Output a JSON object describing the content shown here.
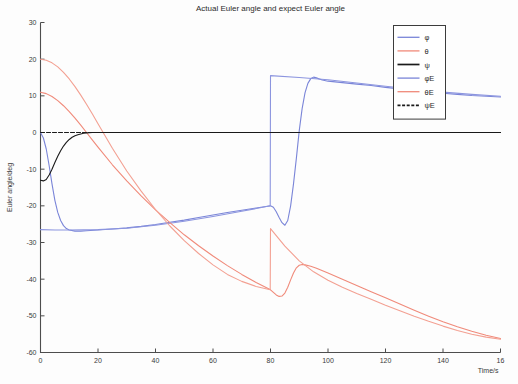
{
  "chart_data": {
    "type": "line",
    "title": "Actual Euler angle and expect Euler angle",
    "xlabel": "Time/s",
    "ylabel": "Euler angle/deg",
    "xlim": [
      0,
      160
    ],
    "ylim": [
      -60,
      30
    ],
    "xticks": [
      0,
      20,
      40,
      60,
      80,
      100,
      120,
      140,
      160
    ],
    "xtick_labels": [
      "0",
      "20",
      "40",
      "60",
      "80",
      "100",
      "120",
      "140",
      "16"
    ],
    "yticks": [
      30,
      20,
      10,
      0,
      -10,
      -20,
      -30,
      -40,
      -50,
      -60
    ],
    "ytick_labels": [
      "30",
      "20",
      "10",
      "0",
      "-10",
      "-20",
      "-30",
      "-40",
      "-50",
      "-60"
    ],
    "grid": false,
    "legend_position": "upper right",
    "legend_entries": [
      {
        "label": "φ",
        "color": "#7a85d8",
        "style": "solid"
      },
      {
        "label": "θ",
        "color": "#f08a7a",
        "style": "solid"
      },
      {
        "label": "ψ",
        "color": "#1a1a1a",
        "style": "solid"
      },
      {
        "label": "φE",
        "color": "#7a85d8",
        "style": "solid"
      },
      {
        "label": "θE",
        "color": "#f08a7a",
        "style": "solid"
      },
      {
        "label": "ψE",
        "color": "#1a1a1a",
        "style": "dashed"
      }
    ],
    "series": [
      {
        "name": "φ",
        "color": "#7a85d8",
        "style": "solid",
        "points": [
          [
            0,
            0
          ],
          [
            1,
            -1.5
          ],
          [
            2,
            -4.5
          ],
          [
            3,
            -9
          ],
          [
            4,
            -14
          ],
          [
            5,
            -18.5
          ],
          [
            6,
            -21.8
          ],
          [
            7,
            -24
          ],
          [
            8,
            -25.4
          ],
          [
            9,
            -26.2
          ],
          [
            10,
            -26.6
          ],
          [
            12,
            -26.9
          ],
          [
            14,
            -26.9
          ],
          [
            16,
            -26.8
          ],
          [
            20,
            -26.6
          ],
          [
            25,
            -26.3
          ],
          [
            30,
            -26.0
          ],
          [
            35,
            -25.6
          ],
          [
            40,
            -25.1
          ],
          [
            45,
            -24.5
          ],
          [
            50,
            -23.9
          ],
          [
            55,
            -23.2
          ],
          [
            60,
            -22.5
          ],
          [
            65,
            -21.8
          ],
          [
            70,
            -21.2
          ],
          [
            75,
            -20.6
          ],
          [
            79,
            -20.1
          ],
          [
            80,
            -20.0
          ],
          [
            81,
            -20.4
          ],
          [
            82,
            -21.6
          ],
          [
            83,
            -23.2
          ],
          [
            84,
            -24.6
          ],
          [
            85,
            -25.3
          ],
          [
            86,
            -24.0
          ],
          [
            87,
            -20.0
          ],
          [
            88,
            -14.0
          ],
          [
            89,
            -7.0
          ],
          [
            90,
            0.5
          ],
          [
            91,
            6.5
          ],
          [
            92,
            10.8
          ],
          [
            93,
            13.4
          ],
          [
            94,
            14.7
          ],
          [
            95,
            15.1
          ],
          [
            96,
            14.9
          ],
          [
            97,
            14.6
          ],
          [
            98,
            14.3
          ],
          [
            100,
            14.0
          ],
          [
            105,
            13.6
          ],
          [
            110,
            13.2
          ],
          [
            115,
            12.8
          ],
          [
            120,
            12.3
          ],
          [
            125,
            11.9
          ],
          [
            130,
            11.5
          ],
          [
            135,
            11.1
          ],
          [
            140,
            10.7
          ],
          [
            145,
            10.4
          ],
          [
            150,
            10.1
          ],
          [
            155,
            9.9
          ],
          [
            160,
            9.7
          ]
        ]
      },
      {
        "name": "φE",
        "color": "#8c95df",
        "style": "solid",
        "points": [
          [
            0,
            -26.5
          ],
          [
            5,
            -26.6
          ],
          [
            10,
            -26.6
          ],
          [
            20,
            -26.5
          ],
          [
            30,
            -26.1
          ],
          [
            40,
            -25.3
          ],
          [
            50,
            -24.2
          ],
          [
            60,
            -22.9
          ],
          [
            70,
            -21.5
          ],
          [
            79.9,
            -20.0
          ],
          [
            80,
            15.5
          ],
          [
            90,
            15.0
          ],
          [
            100,
            14.4
          ],
          [
            110,
            13.5
          ],
          [
            120,
            12.6
          ],
          [
            130,
            11.8
          ],
          [
            140,
            11.0
          ],
          [
            150,
            10.4
          ],
          [
            160,
            9.9
          ]
        ]
      },
      {
        "name": "θ",
        "color": "#f08a7a",
        "style": "solid",
        "points": [
          [
            0,
            11.0
          ],
          [
            2,
            10.6
          ],
          [
            4,
            9.8
          ],
          [
            6,
            8.7
          ],
          [
            8,
            7.3
          ],
          [
            10,
            5.7
          ],
          [
            12,
            3.9
          ],
          [
            14,
            2.0
          ],
          [
            16,
            0.0
          ],
          [
            18,
            -2.0
          ],
          [
            20,
            -4.0
          ],
          [
            25,
            -8.8
          ],
          [
            30,
            -13.2
          ],
          [
            35,
            -17.3
          ],
          [
            40,
            -21.1
          ],
          [
            45,
            -24.6
          ],
          [
            50,
            -27.9
          ],
          [
            55,
            -30.9
          ],
          [
            60,
            -33.7
          ],
          [
            65,
            -36.3
          ],
          [
            70,
            -38.7
          ],
          [
            75,
            -40.9
          ],
          [
            79.5,
            -42.7
          ],
          [
            80,
            -42.9
          ],
          [
            81,
            -43.6
          ],
          [
            82,
            -44.3
          ],
          [
            83,
            -44.7
          ],
          [
            84,
            -44.6
          ],
          [
            85,
            -43.8
          ],
          [
            86,
            -42.2
          ],
          [
            87,
            -40.2
          ],
          [
            88,
            -38.3
          ],
          [
            89,
            -36.9
          ],
          [
            90,
            -36.2
          ],
          [
            91,
            -36.0
          ],
          [
            92,
            -36.1
          ],
          [
            94,
            -36.5
          ],
          [
            96,
            -37.0
          ],
          [
            100,
            -38.3
          ],
          [
            105,
            -40.0
          ],
          [
            110,
            -41.7
          ],
          [
            115,
            -43.4
          ],
          [
            120,
            -45.1
          ],
          [
            125,
            -46.8
          ],
          [
            130,
            -48.5
          ],
          [
            135,
            -50.1
          ],
          [
            140,
            -51.6
          ],
          [
            145,
            -53.0
          ],
          [
            150,
            -54.2
          ],
          [
            155,
            -55.3
          ],
          [
            160,
            -56.2
          ]
        ]
      },
      {
        "name": "θE",
        "color": "#f3a092",
        "style": "solid",
        "points": [
          [
            0,
            20.0
          ],
          [
            2,
            19.7
          ],
          [
            4,
            19.0
          ],
          [
            6,
            17.9
          ],
          [
            8,
            16.4
          ],
          [
            10,
            14.6
          ],
          [
            12,
            12.5
          ],
          [
            14,
            10.2
          ],
          [
            16,
            7.7
          ],
          [
            18,
            5.1
          ],
          [
            20,
            2.4
          ],
          [
            25,
            -4.3
          ],
          [
            30,
            -10.5
          ],
          [
            35,
            -16.0
          ],
          [
            40,
            -21.0
          ],
          [
            45,
            -25.5
          ],
          [
            50,
            -29.5
          ],
          [
            55,
            -33.0
          ],
          [
            60,
            -36.1
          ],
          [
            65,
            -38.7
          ],
          [
            70,
            -40.6
          ],
          [
            75,
            -42.0
          ],
          [
            79.9,
            -42.9
          ],
          [
            80,
            -26.2
          ],
          [
            85,
            -31.0
          ],
          [
            90,
            -35.0
          ],
          [
            95,
            -38.0
          ],
          [
            100,
            -40.3
          ],
          [
            105,
            -42.2
          ],
          [
            110,
            -43.9
          ],
          [
            115,
            -45.5
          ],
          [
            120,
            -47.1
          ],
          [
            125,
            -48.6
          ],
          [
            130,
            -50.1
          ],
          [
            135,
            -51.5
          ],
          [
            140,
            -52.8
          ],
          [
            145,
            -54.0
          ],
          [
            150,
            -55.0
          ],
          [
            155,
            -55.8
          ],
          [
            160,
            -56.4
          ]
        ]
      },
      {
        "name": "ψ",
        "color": "#1a1a1a",
        "style": "solid",
        "points": [
          [
            0,
            -13.0
          ],
          [
            1,
            -13.2
          ],
          [
            2,
            -12.8
          ],
          [
            3,
            -11.6
          ],
          [
            4,
            -10.0
          ],
          [
            5,
            -8.2
          ],
          [
            6,
            -6.5
          ],
          [
            7,
            -5.0
          ],
          [
            8,
            -3.7
          ],
          [
            9,
            -2.7
          ],
          [
            10,
            -1.9
          ],
          [
            11,
            -1.3
          ],
          [
            12,
            -0.9
          ],
          [
            13,
            -0.6
          ],
          [
            14,
            -0.4
          ],
          [
            15,
            -0.2
          ],
          [
            16,
            -0.1
          ],
          [
            18,
            0.0
          ],
          [
            20,
            0.0
          ],
          [
            40,
            0.0
          ],
          [
            60,
            0.0
          ],
          [
            80,
            0.0
          ],
          [
            100,
            0.0
          ],
          [
            120,
            0.0
          ],
          [
            140,
            0.0
          ],
          [
            160,
            0.0
          ]
        ]
      },
      {
        "name": "ψE",
        "color": "#1a1a1a",
        "style": "dashed",
        "points": [
          [
            0,
            0
          ],
          [
            20,
            0
          ],
          [
            40,
            0
          ],
          [
            60,
            0
          ],
          [
            80,
            0
          ],
          [
            100,
            0
          ],
          [
            120,
            0
          ],
          [
            140,
            0
          ],
          [
            160,
            0
          ]
        ]
      }
    ]
  }
}
